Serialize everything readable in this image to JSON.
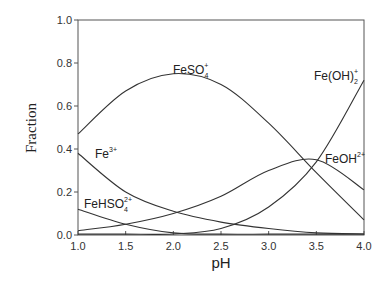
{
  "chart_data": {
    "type": "line",
    "title": "",
    "xlabel": "pH",
    "ylabel": "Fraction",
    "xlim": [
      1.0,
      4.0
    ],
    "ylim": [
      0.0,
      1.0
    ],
    "grid": false,
    "legend_position": "inline labels",
    "x_ticks": [
      "1.0",
      "1.5",
      "2.0",
      "2.5",
      "3.0",
      "3.5",
      "4.0"
    ],
    "y_ticks": [
      "0.0",
      "0.2",
      "0.4",
      "0.6",
      "0.8",
      "1.0"
    ],
    "x": [
      1.0,
      1.5,
      2.0,
      2.5,
      3.0,
      3.5,
      4.0
    ],
    "series": [
      {
        "name": "FeSO4+",
        "label_main": "FeSO",
        "label_sub": "4",
        "label_sup": "+",
        "values": [
          0.47,
          0.67,
          0.75,
          0.7,
          0.52,
          0.29,
          0.07
        ]
      },
      {
        "name": "Fe3+",
        "label_main": "Fe",
        "label_sub": "",
        "label_sup": "3+",
        "values": [
          0.38,
          0.2,
          0.11,
          0.06,
          0.03,
          0.01,
          0.005
        ]
      },
      {
        "name": "FeHSO4 2+",
        "label_main": "FeHSO",
        "label_sub": "4",
        "label_sup": "2+",
        "values": [
          0.12,
          0.05,
          0.01,
          0.003,
          0.001,
          0.0005,
          0.0
        ]
      },
      {
        "name": "FeOH2+",
        "label_main": "FeOH",
        "label_sub": "",
        "label_sup": "2+",
        "values": [
          0.02,
          0.05,
          0.1,
          0.18,
          0.3,
          0.35,
          0.21
        ]
      },
      {
        "name": "Fe(OH)2+",
        "label_main": "Fe(OH)",
        "label_sub": "2",
        "label_sup": "+",
        "values": [
          0.0,
          0.0,
          0.005,
          0.03,
          0.13,
          0.34,
          0.72
        ]
      }
    ]
  }
}
